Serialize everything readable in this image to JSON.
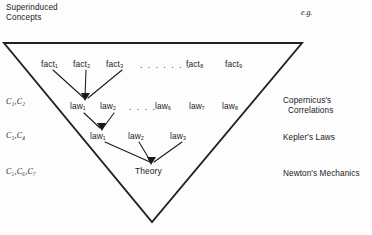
{
  "header": {
    "superinduced_line1": "Superinduced",
    "superinduced_line2": "Concepts",
    "eg": "e.g."
  },
  "concept_labels": [
    {
      "text": "C₁,C₂"
    },
    {
      "text": "C₃,C₄"
    },
    {
      "text": "C₅,C₆,C₇"
    }
  ],
  "example_labels": [
    {
      "line1": "Copernicus's",
      "line2": "Correlations"
    },
    {
      "line1": "Kepler's Laws",
      "line2": ""
    },
    {
      "line1": "Newton's Mechanics",
      "line2": ""
    }
  ],
  "rows": {
    "facts": {
      "items": [
        "fact₁",
        "fact₂",
        "fact₃",
        "fact₈",
        "fact₉"
      ],
      "ellipsis": ". . . . . . ."
    },
    "laws_upper": {
      "items": [
        "law₁",
        "law₂",
        "law₆",
        "law₇",
        "law₈"
      ],
      "ellipsis": ". . . ."
    },
    "laws_lower": {
      "items": [
        "law₁",
        "law₂",
        "law₃"
      ]
    },
    "theory": {
      "label": "Theory"
    }
  },
  "colors": {
    "ink": "#1a1a1a",
    "line": "#222222",
    "background": "#fdfdfd"
  }
}
